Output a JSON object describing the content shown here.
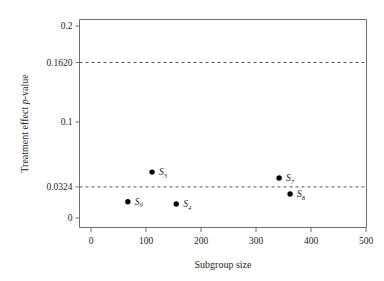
{
  "chart_data": {
    "type": "scatter",
    "title": "",
    "subtitle": "",
    "xlabel": "Subgroup size",
    "ylabel": "Treatment effect p-value",
    "ylabel_parts": {
      "before": "Treatment effect ",
      "italic": "p",
      "after": "-value"
    },
    "xlim": [
      0,
      500
    ],
    "ylim": [
      0,
      0.2
    ],
    "xticks": [
      0,
      100,
      200,
      300,
      400,
      500
    ],
    "xtick_labels": [
      "0",
      "100",
      "200",
      "300",
      "400",
      "500"
    ],
    "yticks": [
      0,
      0.0324,
      0.1,
      0.162,
      0.2
    ],
    "ytick_labels": [
      "0",
      "0.0324",
      "0.1",
      "0.162",
      "0.2"
    ],
    "ytick_labels_display": [
      "0",
      "0.0324",
      "0.1",
      "0.1620",
      "0.2"
    ],
    "grid": false,
    "legend": "none",
    "points": [
      {
        "label": "S",
        "sub": "9",
        "x": 67,
        "y": 0.017,
        "label_dx": 7,
        "label_dy": 3
      },
      {
        "label": "S",
        "sub": "3",
        "x": 111,
        "y": 0.0478,
        "label_dx": 7,
        "label_dy": 3
      },
      {
        "label": "S",
        "sub": "4",
        "x": 155,
        "y": 0.0146,
        "label_dx": 7,
        "label_dy": 3
      },
      {
        "label": "S",
        "sub": "7",
        "x": 342,
        "y": 0.0417,
        "label_dx": 7,
        "label_dy": 3
      },
      {
        "label": "S",
        "sub": "8",
        "x": 362,
        "y": 0.025,
        "label_dx": 7,
        "label_dy": 3
      }
    ],
    "reference_lines": [
      {
        "name": "upper-threshold",
        "y": 0.162,
        "style": "dashed",
        "color": "#555555"
      },
      {
        "name": "lower-threshold",
        "y": 0.0324,
        "style": "dashed",
        "color": "#555555"
      }
    ],
    "colors": {
      "point": "#000000",
      "axis": "#6e6e6e",
      "reference_line": "#555555",
      "background": "#ffffff",
      "text": "#231f20"
    }
  }
}
